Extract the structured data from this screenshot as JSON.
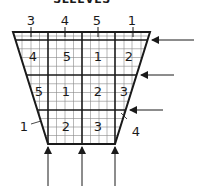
{
  "title": "SLEEVES",
  "top_labels": [
    "3",
    "4",
    "5",
    "1"
  ],
  "row1_labels": [
    "4",
    "5",
    "1",
    "2"
  ],
  "row2_labels": [
    "5",
    "1",
    "2",
    "3"
  ],
  "row3_labels": [
    "2",
    "3"
  ],
  "side_labels": {
    "left": "1",
    "right": "4"
  },
  "colors": {
    "line": "#1a1a1a",
    "grid": "#888888",
    "background": "#ffffff"
  }
}
